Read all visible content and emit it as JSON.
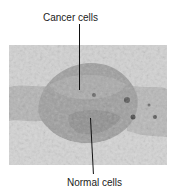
{
  "figure": {
    "top_label": "Cancer cells",
    "bottom_label": "Normal cells"
  }
}
